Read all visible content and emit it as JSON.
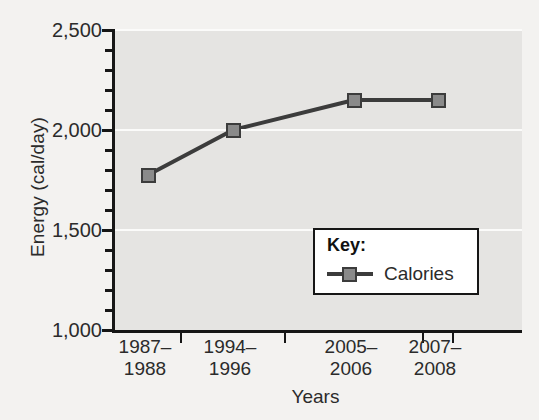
{
  "chart_data": {
    "type": "line",
    "title": "",
    "xlabel": "Years",
    "ylabel": "Energy (cal/day)",
    "categories": [
      "1987–\n1988",
      "1994–\n1996",
      "2005–\n2006",
      "2007–\n2008"
    ],
    "series": [
      {
        "name": "Calories",
        "values": [
          1775,
          2000,
          2150,
          2150
        ]
      }
    ],
    "ylim": [
      1000,
      2500
    ],
    "ytick_labels": [
      "1,000",
      "1,500",
      "2,000",
      "2,500"
    ],
    "ytick_values": [
      1000,
      1500,
      2000,
      2500
    ],
    "yminor_step": 100,
    "grid": true,
    "legend_position": "inside-lower-right",
    "colors": {
      "marker_fill": "#8a8a8a",
      "marker_edge": "#3c3c3c",
      "line": "#3c3c3c",
      "plot_background": "#e5e4e2",
      "figure_background": "#f3f2f0",
      "axis": "#161616",
      "gridline": "#fbfbfa",
      "text": "#2b2b2b"
    }
  },
  "legend": {
    "title": "Key:",
    "entries": [
      {
        "label": "Calories"
      }
    ]
  }
}
